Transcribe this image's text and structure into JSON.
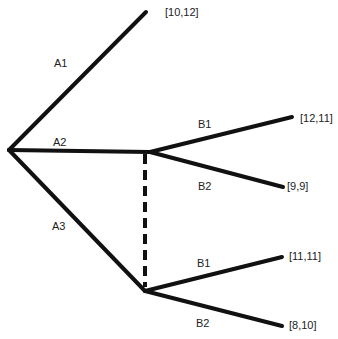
{
  "diagram": {
    "type": "game-tree",
    "actions": {
      "a1": "A1",
      "a2": "A2",
      "a3": "A3",
      "b1_upper": "B1",
      "b2_upper": "B2",
      "b1_lower": "B1",
      "b2_lower": "B2"
    },
    "payoffs": {
      "a1": "[10,12]",
      "a2_b1": "[12,11]",
      "a2_b2": "[9,9]",
      "a3_b1": "[11,11]",
      "a3_b2": "[8,10]"
    },
    "information_set": "dashed line connecting A2 and A3 decision nodes"
  }
}
